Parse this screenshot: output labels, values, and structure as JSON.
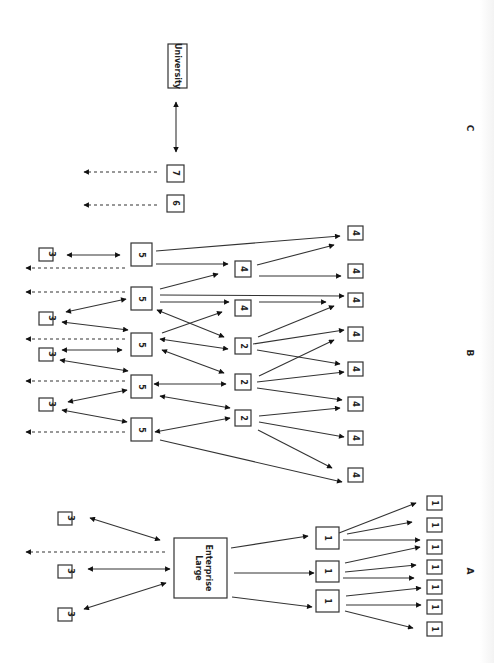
{
  "diagram": {
    "orientation": "rotated 90 degrees clockwise",
    "sections": [
      {
        "id": "A",
        "label": "A"
      },
      {
        "id": "B",
        "label": "B"
      },
      {
        "id": "C",
        "label": "C"
      }
    ],
    "nodes": {
      "large_enterprise": "Large\nEnterprise",
      "large_enterprise_line1": "Large",
      "large_enterprise_line2": "Enterprise",
      "university": "University",
      "one": "1",
      "two": "2",
      "three": "3",
      "four": "4",
      "five": "5",
      "six": "6",
      "seven": "7"
    },
    "section_a": {
      "center": "Large Enterprise",
      "suppliers_tier1": [
        "1",
        "1",
        "1"
      ],
      "suppliers_tier2": [
        "1",
        "1",
        "1",
        "1",
        "1",
        "1",
        "1"
      ],
      "partners": [
        "3",
        "3",
        "3"
      ]
    },
    "section_b": {
      "fives": [
        "5",
        "5",
        "5",
        "5",
        "5"
      ],
      "threes": [
        "3",
        "3",
        "3",
        "3"
      ],
      "twos": [
        "2",
        "2",
        "2"
      ],
      "fours_mid": [
        "4",
        "4"
      ],
      "fours_outer": [
        "4",
        "4",
        "4",
        "4",
        "4",
        "4",
        "4",
        "4"
      ]
    },
    "section_c": {
      "nodes": [
        "6",
        "7",
        "University"
      ]
    }
  }
}
